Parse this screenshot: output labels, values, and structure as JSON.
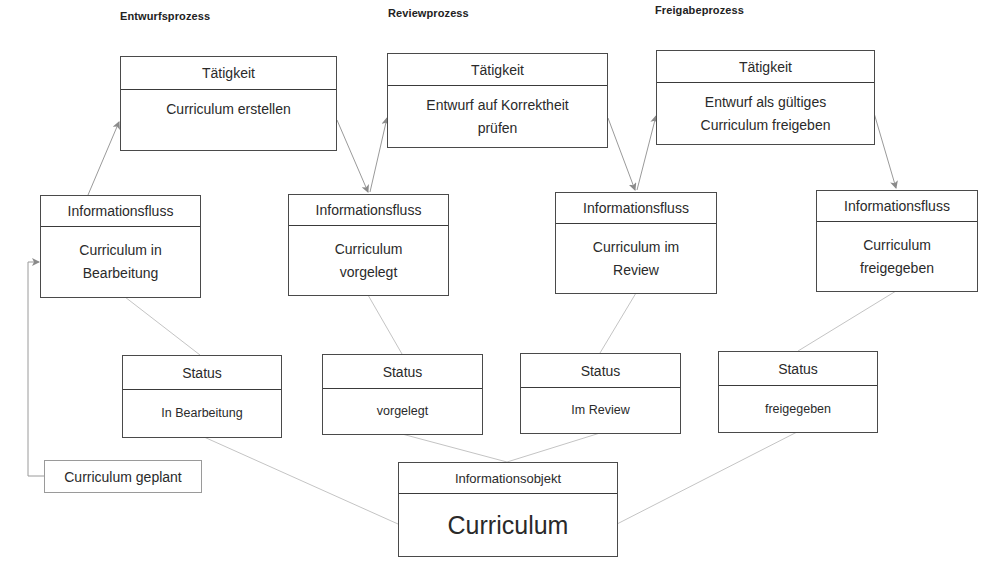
{
  "diagram": {
    "processes": [
      {
        "label": "Entwurfsprozess",
        "activity": {
          "header": "Tätigkeit",
          "text": "Curriculum erstellen"
        },
        "info_flow": {
          "header": "Informationsfluss",
          "text": "Curriculum in Bearbeitung"
        },
        "status": {
          "header": "Status",
          "text": "In Bearbeitung"
        }
      },
      {
        "label": "Reviewprozess",
        "activity": {
          "header": "Tätigkeit",
          "text": "Entwurf auf Korrektheit prüfen"
        },
        "info_flow": {
          "header": "Informationsfluss",
          "text": "Curriculum vorgelegt"
        },
        "status": {
          "header": "Status",
          "text": "vorgelegt"
        }
      },
      {
        "label": "Freigabeprozess",
        "activity": {
          "header": "Tätigkeit",
          "text": "Entwurf als gültiges Curriculum freigeben"
        },
        "info_flow": {
          "header": "Informationsfluss",
          "text": "Curriculum im Review"
        },
        "status": {
          "header": "Status",
          "text": "Im Review"
        }
      },
      {
        "info_flow": {
          "header": "Informationsfluss",
          "text": "Curriculum freigegeben"
        },
        "status": {
          "header": "Status",
          "text": "freigegeben"
        }
      }
    ],
    "start_state": "Curriculum geplant",
    "info_object": {
      "header": "Informationsobjekt",
      "text": "Curriculum"
    },
    "colors": {
      "box_border": "#4a4a4a",
      "connector": "#b8b8b8",
      "arrow": "#8a8a8a",
      "text": "#2a2a2a"
    }
  }
}
